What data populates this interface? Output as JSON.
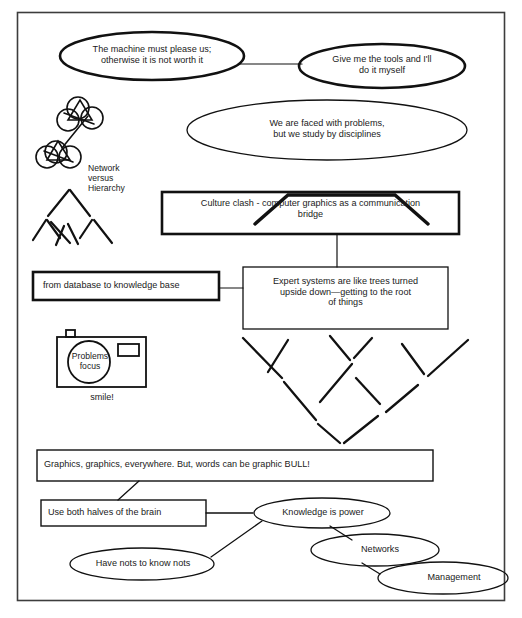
{
  "diagram": {
    "border_color": "#3d3d3d",
    "ink_color": "#111111",
    "background": "#ffffff",
    "nodes": {
      "machine_please": {
        "shape": "ellipse-bold",
        "text": "The machine must please us;\notherwise it is not worth it"
      },
      "give_tools": {
        "shape": "ellipse-bold",
        "text": "Give me the tools and I'll\ndo it myself"
      },
      "faced_problems": {
        "shape": "ellipse",
        "text": "We are faced with problems,\nbut we study by disciplines"
      },
      "culture_clash": {
        "shape": "box-bold",
        "text": "Culture clash -  computer graphics as a communication\nbridge"
      },
      "database_kb": {
        "shape": "box-bold",
        "text": "from database to knowledge base"
      },
      "expert_systems": {
        "shape": "box",
        "text": "Expert systems are like trees turned\nupside down—getting to the root\nof things"
      },
      "graphics_everywhere": {
        "shape": "box",
        "text": "Graphics, graphics, everywhere.    But, words can be graphic     BULL!"
      },
      "both_halves": {
        "shape": "box",
        "text": "Use both halves of the brain"
      },
      "knowledge_power": {
        "shape": "ellipse",
        "text": "Knowledge is power"
      },
      "have_nots": {
        "shape": "ellipse",
        "text": "Have nots to know nots"
      },
      "networks": {
        "shape": "ellipse",
        "text": "Networks"
      },
      "management": {
        "shape": "ellipse",
        "text": "Management"
      }
    },
    "sketches": {
      "network_hierarchy_caption": "Network\nversus\nHierarchy",
      "camera_lens_label": "Problems\nfocus",
      "camera_caption": "smile!",
      "network_icon_name": "network-cluster-icon",
      "hierarchy_icon_name": "hierarchy-tree-icon",
      "inverted_tree_icon_name": "inverted-tree-icon",
      "camera_icon_name": "camera-icon"
    },
    "connections": [
      {
        "from": "machine_please",
        "to": "give_tools"
      },
      {
        "from": "faced_problems",
        "to": "culture_clash"
      },
      {
        "from": "culture_clash",
        "to": "expert_systems"
      },
      {
        "from": "database_kb",
        "to": "expert_systems"
      },
      {
        "from": "graphics_everywhere",
        "to": "both_halves"
      },
      {
        "from": "both_halves",
        "to": "knowledge_power"
      },
      {
        "from": "knowledge_power",
        "to": "have_nots"
      },
      {
        "from": "knowledge_power",
        "to": "networks"
      },
      {
        "from": "networks",
        "to": "management"
      }
    ]
  }
}
